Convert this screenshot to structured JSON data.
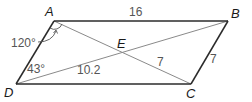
{
  "diagram": {
    "type": "parallelogram-with-diagonals",
    "vertices": {
      "A": {
        "label": "A",
        "x": 54,
        "y": 21
      },
      "B": {
        "label": "B",
        "x": 228,
        "y": 21
      },
      "C": {
        "label": "C",
        "x": 191,
        "y": 84
      },
      "D": {
        "label": "D",
        "x": 16,
        "y": 84
      },
      "E": {
        "label": "E",
        "x": 122,
        "y": 53
      }
    },
    "measurements": {
      "AB": "16",
      "BC": "7",
      "EC": "7",
      "DE": "10.2",
      "angle_A": "120°",
      "angle_D": "43°"
    },
    "colors": {
      "sides": "#2b2b2b",
      "diagonals": "#8a8a8a",
      "labels": "#555555",
      "vertex_labels": "#1a1a1a"
    }
  }
}
